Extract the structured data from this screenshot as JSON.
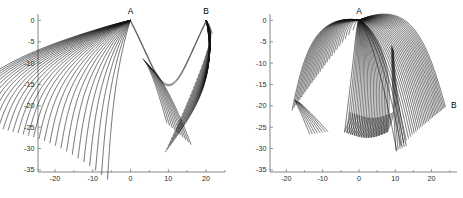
{
  "figure": {
    "background_color": "#ffffff",
    "curve_color": "#141414",
    "axis_color": "#555555",
    "panels": [
      "left",
      "right"
    ]
  },
  "chart_data": [
    {
      "type": "line",
      "panel": "left",
      "title": "",
      "xlabel": "",
      "ylabel": "",
      "xlim": [
        -24.5,
        25.0
      ],
      "ylim": [
        -35.5,
        1.5
      ],
      "xticks": [
        -20,
        -10,
        0,
        10,
        20
      ],
      "xticklabels": [
        "-20",
        "-10",
        "0",
        "10",
        "20"
      ],
      "yticks": [
        0,
        -5,
        -10,
        -15,
        -20,
        -25,
        -30,
        -35
      ],
      "yticklabels": [
        "0",
        "-5",
        "-10",
        "-15",
        "-20",
        "-25",
        "-30",
        "-35"
      ],
      "grid": false,
      "legend": null,
      "annotations": [
        {
          "text": "A",
          "x": 0.0,
          "y": 0.0,
          "dx": 0,
          "dy": -6
        },
        {
          "text": "B",
          "x": 20.0,
          "y": 0.0,
          "dx": 0,
          "dy": -6
        }
      ],
      "description": "Family of ray trajectories radiating from source point A at (0,0) sweeping left and down, and a second fan converging on B at (20,0); the two fans meet along a caustic envelope with a minimum near (7,-13).",
      "n_curves": 62,
      "series": [
        {
          "name": "fan-A-left",
          "n": 30,
          "origin": [
            0,
            0
          ],
          "spread": "leftward",
          "terminal_band": [
            -23,
            -30
          ]
        },
        {
          "name": "fan-B-right",
          "n": 30,
          "origin": [
            20,
            0
          ],
          "spread": "rightward-down",
          "terminal_band": [
            -20,
            -31
          ]
        },
        {
          "name": "caustic-envelope",
          "n": 2,
          "vertex": [
            7,
            -13
          ]
        }
      ]
    },
    {
      "type": "line",
      "panel": "right",
      "title": "",
      "xlabel": "",
      "ylabel": "",
      "xlim": [
        -24.5,
        27.0
      ],
      "ylim": [
        -35.5,
        1.5
      ],
      "xticks": [
        -20,
        -10,
        0,
        10,
        20
      ],
      "xticklabels": [
        "-20",
        "-10",
        "0",
        "10",
        "20"
      ],
      "yticks": [
        0,
        -5,
        -10,
        -15,
        -20,
        -25,
        -30,
        -35
      ],
      "yticklabels": [
        "0",
        "-5",
        "-10",
        "-15",
        "-20",
        "-25",
        "-30",
        "-35"
      ],
      "grid": false,
      "legend": null,
      "annotations": [
        {
          "text": "A",
          "x": 0.0,
          "y": 0.0,
          "dx": 0,
          "dy": -6
        },
        {
          "text": "B",
          "x": 24.0,
          "y": -20.0,
          "dx": 5,
          "dy": 2
        }
      ],
      "description": "Same source point A at (0,0) with fans sweeping left and right; trajectories turn around in a row of narrow U-shaped loops along the lower boundary near y = -27, and the right fan folds into point B at (24,-20).",
      "n_curves": 66,
      "series": [
        {
          "name": "fan-A-left",
          "n": 26,
          "origin": [
            0,
            0
          ],
          "spread": "leftward",
          "terminal_band": [
            -19,
            -27
          ]
        },
        {
          "name": "fan-A-right",
          "n": 28,
          "origin": [
            0,
            0
          ],
          "spread": "rightward",
          "loops": 11,
          "loop_depth": -27
        },
        {
          "name": "fold-to-B",
          "n": 12,
          "target": [
            24,
            -20
          ]
        }
      ]
    }
  ]
}
